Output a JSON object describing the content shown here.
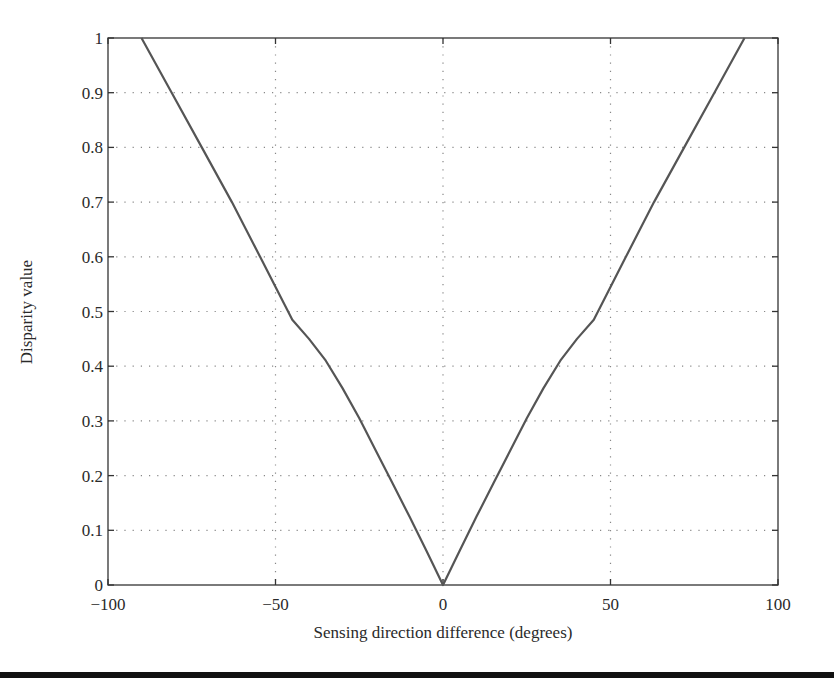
{
  "chart_data": {
    "type": "line",
    "title": "",
    "xlabel": "Sensing direction difference (degrees)",
    "ylabel": "Disparity value",
    "xlim": [
      -100,
      100
    ],
    "ylim": [
      0,
      1
    ],
    "xticks": [
      -100,
      -50,
      0,
      50,
      100
    ],
    "xtick_labels": [
      "−100",
      "−50",
      "0",
      "50",
      "100"
    ],
    "yticks": [
      0,
      0.1,
      0.2,
      0.3,
      0.4,
      0.5,
      0.6,
      0.7,
      0.8,
      0.9,
      1
    ],
    "ytick_labels": [
      "0",
      "0.1",
      "0.2",
      "0.3",
      "0.4",
      "0.5",
      "0.6",
      "0.7",
      "0.8",
      "0.9",
      "1"
    ],
    "grid": true,
    "grid_style": "dotted",
    "legend": null,
    "line_color": "#555555",
    "series": [
      {
        "name": "disparity",
        "x": [
          -90,
          -81,
          -72,
          -63,
          -54.6,
          -45,
          -40,
          -35,
          -30,
          -25,
          -20,
          -15,
          -10,
          -5,
          0,
          5,
          10,
          15,
          20,
          25,
          30,
          35,
          40,
          45,
          54.6,
          63,
          72,
          81,
          90
        ],
        "y": [
          1.0,
          0.9,
          0.8,
          0.7,
          0.6,
          0.485,
          0.45,
          0.41,
          0.36,
          0.305,
          0.245,
          0.185,
          0.125,
          0.063,
          0.0,
          0.063,
          0.125,
          0.185,
          0.245,
          0.305,
          0.36,
          0.41,
          0.45,
          0.485,
          0.6,
          0.7,
          0.8,
          0.9,
          1.0
        ]
      }
    ]
  }
}
